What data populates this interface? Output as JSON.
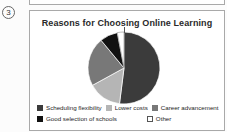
{
  "item_number": "3",
  "panel": {
    "border_color": "#a9a9a9",
    "background": "#ffffff"
  },
  "chart_data": {
    "type": "pie",
    "title": "Reasons for Choosing Online Learning",
    "categories": [
      "Scheduling flexibility",
      "Lower costs",
      "Career advancement",
      "Good selection of schools",
      "Other"
    ],
    "values": [
      52,
      15,
      22,
      8,
      3
    ],
    "colors": [
      "#3b3b3b",
      "#b5b5b5",
      "#787878",
      "#111111",
      "#ffffff"
    ],
    "slice_strokes": [
      "#ffffff",
      "#ffffff",
      "#ffffff",
      "#ffffff",
      "#777777"
    ],
    "start_angle": "12 o'clock, clockwise",
    "legend_position": "bottom",
    "legend_rows": [
      [
        0,
        1,
        2
      ],
      [
        3,
        4
      ]
    ],
    "swatch_border_color": "#555555"
  }
}
